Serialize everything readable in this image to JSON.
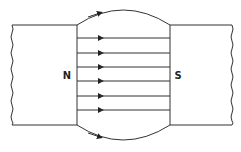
{
  "diagram": {
    "poles": {
      "north": {
        "label": "N"
      },
      "south": {
        "label": "S"
      }
    },
    "field_lines": {
      "straight_count": 6,
      "curved_count": 2,
      "direction": "N to S"
    },
    "colors": {
      "stroke": "#333333",
      "background": "#ffffff"
    }
  }
}
